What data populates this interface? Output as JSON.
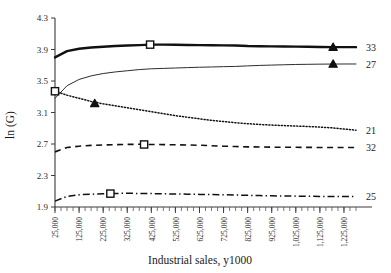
{
  "chart_data": {
    "type": "line",
    "title": "",
    "xlabel": "Industrial sales, y1000",
    "ylabel": "ln (G)",
    "xlim": [
      25000,
      1275000
    ],
    "ylim": [
      1.9,
      4.3
    ],
    "grid": false,
    "legend_position": "right-end-of-line",
    "ytick_labels": [
      "4.3",
      "3.9",
      "3.5",
      "3.1",
      "2.7",
      "2.3",
      "1.9"
    ],
    "ytick_values": [
      4.3,
      3.9,
      3.5,
      3.1,
      2.7,
      2.3,
      1.9
    ],
    "xtick_labels": [
      "25,000",
      "125,000",
      "225,000",
      "325,000",
      "425,000",
      "525,000",
      "625,000",
      "725,000",
      "825,000",
      "925,000",
      "1,025,000",
      "1,125,000",
      "1,225,000"
    ],
    "xtick_values": [
      25000,
      125000,
      225000,
      325000,
      425000,
      525000,
      625000,
      725000,
      825000,
      925000,
      1025000,
      1125000,
      1225000
    ],
    "x": [
      25000,
      75000,
      125000,
      175000,
      225000,
      275000,
      325000,
      375000,
      425000,
      475000,
      525000,
      575000,
      625000,
      675000,
      725000,
      775000,
      825000,
      875000,
      925000,
      975000,
      1025000,
      1075000,
      1125000,
      1175000,
      1225000,
      1275000
    ],
    "series": [
      {
        "name": "33",
        "label": "33",
        "style": "solid-thick",
        "color": "#111111",
        "values": [
          3.8,
          3.88,
          3.91,
          3.925,
          3.935,
          3.945,
          3.95,
          3.955,
          3.962,
          3.962,
          3.96,
          3.958,
          3.956,
          3.954,
          3.952,
          3.95,
          3.944,
          3.942,
          3.94,
          3.938,
          3.936,
          3.934,
          3.932,
          3.93,
          3.93,
          3.93
        ],
        "markers": [
          {
            "x": 420000,
            "y": 3.962,
            "shape": "square"
          },
          {
            "x": 1180000,
            "y": 3.93,
            "shape": "triangle"
          }
        ]
      },
      {
        "name": "27",
        "label": "27",
        "style": "solid-thin",
        "color": "#2e2e2e",
        "values": [
          3.28,
          3.44,
          3.52,
          3.565,
          3.595,
          3.615,
          3.63,
          3.645,
          3.655,
          3.66,
          3.665,
          3.67,
          3.675,
          3.678,
          3.682,
          3.685,
          3.692,
          3.698,
          3.702,
          3.706,
          3.71,
          3.712,
          3.714,
          3.715,
          3.716,
          3.716
        ],
        "markers": [
          {
            "x": 1180000,
            "y": 3.715,
            "shape": "triangle"
          }
        ]
      },
      {
        "name": "21",
        "label": "21",
        "style": "dotted",
        "color": "#111111",
        "values": [
          3.37,
          3.32,
          3.28,
          3.24,
          3.21,
          3.185,
          3.16,
          3.135,
          3.11,
          3.085,
          3.06,
          3.04,
          3.02,
          3.0,
          2.985,
          2.97,
          2.958,
          2.948,
          2.94,
          2.934,
          2.928,
          2.922,
          2.915,
          2.905,
          2.89,
          2.875
        ],
        "markers": [
          {
            "x": 25000,
            "y": 3.37,
            "shape": "square"
          },
          {
            "x": 190000,
            "y": 3.215,
            "shape": "triangle"
          }
        ]
      },
      {
        "name": "32",
        "label": "32",
        "style": "dashed",
        "color": "#111111",
        "values": [
          2.6,
          2.655,
          2.672,
          2.682,
          2.688,
          2.692,
          2.695,
          2.696,
          2.694,
          2.692,
          2.69,
          2.688,
          2.684,
          2.678,
          2.672,
          2.668,
          2.664,
          2.662,
          2.66,
          2.658,
          2.658,
          2.657,
          2.656,
          2.656,
          2.656,
          2.656
        ],
        "markers": [
          {
            "x": 395000,
            "y": 2.694,
            "shape": "square"
          }
        ]
      },
      {
        "name": "25",
        "label": "25",
        "style": "dash-dot",
        "color": "#111111",
        "values": [
          1.975,
          2.035,
          2.055,
          2.062,
          2.068,
          2.072,
          2.074,
          2.072,
          2.07,
          2.068,
          2.065,
          2.063,
          2.06,
          2.058,
          2.056,
          2.052,
          2.048,
          2.045,
          2.042,
          2.04,
          2.038,
          2.036,
          2.034,
          2.033,
          2.032,
          2.032
        ],
        "markers": [
          {
            "x": 255000,
            "y": 2.07,
            "shape": "square"
          }
        ]
      }
    ]
  }
}
